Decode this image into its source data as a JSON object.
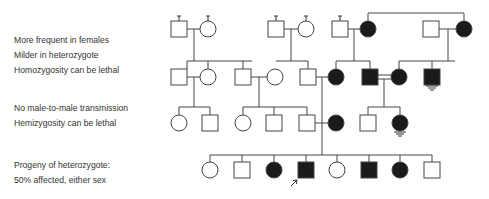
{
  "notes": {
    "group1": [
      "More frequent in females",
      "Milder in heterozygote",
      "Homozygosity can be lethal"
    ],
    "group2": [
      "No male-to-male transmission",
      "Hemizygosity can be lethal"
    ],
    "group3": [
      "Progeny of heterozygote:",
      "50% affected, either sex"
    ]
  },
  "pedigree": {
    "colors": {
      "line": "#444444",
      "fill": "#1a1a1a",
      "unaffected": "#ffffff"
    },
    "generations": [
      {
        "label": "I",
        "individuals": [
          {
            "sex": "male",
            "affected": false,
            "x": 179,
            "stub": true
          },
          {
            "sex": "female",
            "affected": false,
            "x": 208,
            "stub": true
          },
          {
            "sex": "male",
            "affected": false,
            "x": 276,
            "stub": true
          },
          {
            "sex": "female",
            "affected": false,
            "x": 306,
            "stub": true
          },
          {
            "sex": "male",
            "affected": false,
            "x": 340,
            "stub": true
          },
          {
            "sex": "female",
            "affected": true,
            "x": 368
          },
          {
            "sex": "male",
            "affected": false,
            "x": 431
          },
          {
            "sex": "female",
            "affected": true,
            "x": 464
          }
        ]
      },
      {
        "label": "II",
        "individuals": [
          {
            "sex": "male",
            "affected": false,
            "x": 179
          },
          {
            "sex": "female",
            "affected": false,
            "x": 208
          },
          {
            "sex": "male",
            "affected": false,
            "x": 243
          },
          {
            "sex": "female",
            "affected": false,
            "x": 275
          },
          {
            "sex": "male",
            "affected": false,
            "x": 308
          },
          {
            "sex": "female",
            "affected": true,
            "x": 336
          },
          {
            "sex": "male",
            "affected": true,
            "x": 370
          },
          {
            "sex": "female",
            "affected": true,
            "x": 399
          },
          {
            "sex": "male",
            "affected": true,
            "x": 432,
            "deceased_lethal": true
          }
        ]
      },
      {
        "label": "III",
        "individuals": [
          {
            "sex": "female",
            "affected": false,
            "x": 179
          },
          {
            "sex": "male",
            "affected": false,
            "x": 210
          },
          {
            "sex": "female",
            "affected": false,
            "x": 243
          },
          {
            "sex": "male",
            "affected": false,
            "x": 274
          },
          {
            "sex": "male",
            "affected": false,
            "x": 307
          },
          {
            "sex": "female",
            "affected": true,
            "x": 336
          },
          {
            "sex": "male",
            "affected": false,
            "x": 368
          },
          {
            "sex": "female",
            "affected": true,
            "x": 400,
            "deceased_lethal": true
          }
        ]
      },
      {
        "label": "IV",
        "individuals": [
          {
            "sex": "female",
            "affected": false,
            "x": 210
          },
          {
            "sex": "male",
            "affected": false,
            "x": 242
          },
          {
            "sex": "female",
            "affected": true,
            "x": 274
          },
          {
            "sex": "male",
            "affected": true,
            "x": 306,
            "proband": true
          },
          {
            "sex": "female",
            "affected": false,
            "x": 337
          },
          {
            "sex": "male",
            "affected": true,
            "x": 369
          },
          {
            "sex": "female",
            "affected": true,
            "x": 400
          },
          {
            "sex": "male",
            "affected": false,
            "x": 432
          }
        ]
      }
    ],
    "proband_marker": "arrow"
  }
}
